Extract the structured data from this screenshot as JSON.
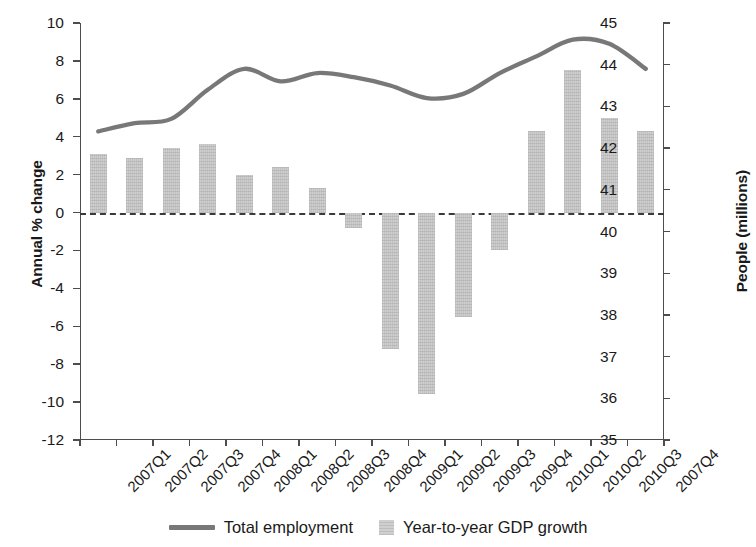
{
  "chart_data": {
    "type": "bar",
    "title": "",
    "subtitle": "",
    "categories": [
      "2007Q1",
      "2007Q2",
      "2007Q3",
      "2007Q4",
      "2008Q1",
      "2008Q2",
      "2008Q3",
      "2008Q4",
      "2009Q1",
      "2009Q2",
      "2009Q3",
      "2009Q4",
      "2010Q1",
      "2010Q2",
      "2010Q3",
      "2007Q4"
    ],
    "xlabel": "",
    "ylabel": "Annual % change",
    "y2label": "People (millions)",
    "ylim": [
      -12,
      10
    ],
    "y2lim": [
      35,
      45
    ],
    "yticks": [
      10,
      8,
      6,
      4,
      2,
      0,
      -2,
      -4,
      -6,
      -8,
      -10,
      -12
    ],
    "ytick_labels": [
      "10",
      "8",
      "6",
      "4",
      "2",
      "0",
      "-2",
      "-4",
      "-6",
      "-8",
      "-10",
      "-12"
    ],
    "y2ticks": [
      45,
      44,
      43,
      42,
      41,
      40,
      39,
      38,
      37,
      36,
      35
    ],
    "y2tick_labels": [
      "45",
      "44",
      "43",
      "42",
      "41",
      "40",
      "39",
      "38",
      "37",
      "36",
      "35"
    ],
    "grid": false,
    "zero_line": true,
    "legend_position": "bottom",
    "series": [
      {
        "name": "Year-to-year GDP growth",
        "type": "bar",
        "axis": "left",
        "color": "#cfcfcf",
        "unit": "Annual % change",
        "values": [
          3.1,
          2.9,
          3.4,
          3.6,
          2.0,
          2.4,
          1.3,
          -0.8,
          -7.2,
          -9.6,
          -5.5,
          -2.0,
          4.3,
          7.5,
          5.0,
          4.3
        ]
      },
      {
        "name": "Total employment",
        "type": "line",
        "axis": "right",
        "color": "#787878",
        "unit": "People (millions)",
        "values": [
          42.4,
          42.6,
          42.7,
          43.4,
          43.9,
          43.6,
          43.8,
          43.7,
          43.5,
          43.2,
          43.3,
          43.8,
          44.2,
          44.6,
          44.5,
          43.9
        ]
      }
    ]
  },
  "legend": {
    "entries": [
      {
        "label": "Total employment",
        "marker": "line",
        "color": "#787878"
      },
      {
        "label": "Year-to-year GDP growth",
        "marker": "square",
        "color": "#cfcfcf"
      }
    ]
  },
  "axes": {
    "left_title": "Annual % change",
    "right_title": "People (millions)"
  }
}
